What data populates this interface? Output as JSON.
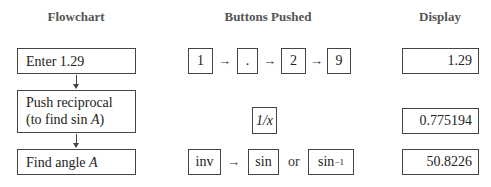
{
  "headers": {
    "flowchart": "Flowchart",
    "buttons": "Buttons Pushed",
    "display": "Display"
  },
  "rows": [
    {
      "step": "Enter 1.29",
      "buttons": [
        "1",
        ".",
        "2",
        "9"
      ],
      "display": "1.29"
    },
    {
      "step_line1": "Push reciprocal",
      "step_line2_prefix": "(to find sin ",
      "step_line2_var": "A",
      "step_line2_suffix": ")",
      "buttons": [
        "1/x"
      ],
      "display": "0.775194"
    },
    {
      "step_prefix": "Find angle ",
      "step_var": "A",
      "buttons": [
        "inv",
        "sin",
        "sin"
      ],
      "alt_text": "or",
      "superscript": "−1",
      "display": "50.8226"
    }
  ],
  "arrow_symbol": "→"
}
